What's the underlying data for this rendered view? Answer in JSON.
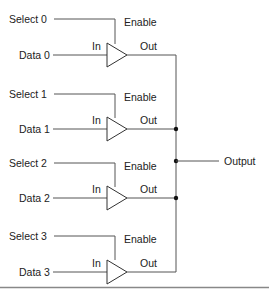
{
  "diagram": {
    "type": "tri-state buffer multiplexer",
    "colors": {
      "wire": "#555555",
      "text": "#222222",
      "junction": "#111111",
      "divider": "#888888"
    },
    "buffers": [
      {
        "select_label": "Select 0",
        "data_label": "Data 0",
        "enable_label": "Enable",
        "in_label": "In",
        "out_label": "Out"
      },
      {
        "select_label": "Select 1",
        "data_label": "Data 1",
        "enable_label": "Enable",
        "in_label": "In",
        "out_label": "Out"
      },
      {
        "select_label": "Select 2",
        "data_label": "Data 2",
        "enable_label": "Enable",
        "in_label": "In",
        "out_label": "Out"
      },
      {
        "select_label": "Select 3",
        "data_label": "Data 3",
        "enable_label": "Enable",
        "in_label": "In",
        "out_label": "Out"
      }
    ],
    "output_label": "Output"
  }
}
